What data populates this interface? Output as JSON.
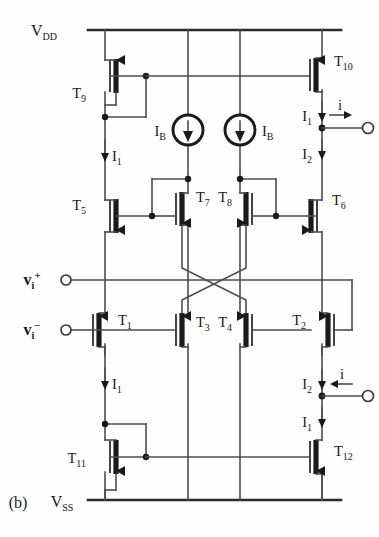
{
  "figure": {
    "caption": "(b)",
    "type": "cmos-class-ab-transconductor-schematic"
  },
  "rails": {
    "top": {
      "name": "V_DD",
      "text": "V",
      "sub": "DD"
    },
    "bottom": {
      "name": "V_SS",
      "text": "V",
      "sub": "SS"
    }
  },
  "inputs": [
    {
      "name": "vi-plus",
      "text": "v",
      "sub": "i",
      "sup": "+"
    },
    {
      "name": "vi-minus",
      "text": "v",
      "sub": "i",
      "sup": "−"
    }
  ],
  "transistors": [
    {
      "id": "T1",
      "text": "T",
      "sub": "1",
      "type": "pmos"
    },
    {
      "id": "T2",
      "text": "T",
      "sub": "2",
      "type": "pmos"
    },
    {
      "id": "T3",
      "text": "T",
      "sub": "3",
      "type": "pmos"
    },
    {
      "id": "T4",
      "text": "T",
      "sub": "4",
      "type": "pmos"
    },
    {
      "id": "T5",
      "text": "T",
      "sub": "5",
      "type": "nmos"
    },
    {
      "id": "T6",
      "text": "T",
      "sub": "6",
      "type": "nmos"
    },
    {
      "id": "T7",
      "text": "T",
      "sub": "7",
      "type": "nmos"
    },
    {
      "id": "T8",
      "text": "T",
      "sub": "8",
      "type": "nmos"
    },
    {
      "id": "T9",
      "text": "T",
      "sub": "9",
      "type": "pmos"
    },
    {
      "id": "T10",
      "text": "T",
      "sub": "10",
      "type": "pmos"
    },
    {
      "id": "T11",
      "text": "T",
      "sub": "11",
      "type": "nmos"
    },
    {
      "id": "T12",
      "text": "T",
      "sub": "12",
      "type": "nmos"
    }
  ],
  "currents": [
    {
      "name": "I1-left-upper",
      "text": "I",
      "sub": "1",
      "dir": "down"
    },
    {
      "name": "I1-left-lower",
      "text": "I",
      "sub": "1",
      "dir": "down"
    },
    {
      "name": "I1-right-upper",
      "text": "I",
      "sub": "1",
      "dir": "down"
    },
    {
      "name": "I2-right-upper",
      "text": "I",
      "sub": "2",
      "dir": "down"
    },
    {
      "name": "I2-right-lower",
      "text": "I",
      "sub": "2",
      "dir": "down"
    },
    {
      "name": "I1-right-lower",
      "text": "I",
      "sub": "1",
      "dir": "down"
    }
  ],
  "bias_sources": [
    {
      "name": "IB-left",
      "text": "I",
      "sub": "B",
      "dir": "down"
    },
    {
      "name": "IB-right",
      "text": "I",
      "sub": "B",
      "dir": "down"
    }
  ],
  "outputs": [
    {
      "name": "i-top",
      "text": "i",
      "dir": "right"
    },
    {
      "name": "i-bottom",
      "text": "i",
      "dir": "left"
    }
  ],
  "colors": {
    "wire": "#4d4d52",
    "device": "#1a1a1c",
    "background": "#fefefe"
  }
}
